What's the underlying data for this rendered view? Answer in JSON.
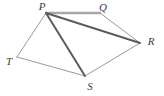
{
  "figure": {
    "background_color": "#ffffff",
    "width": 164,
    "height": 96,
    "labels": {
      "p": "P",
      "q": "Q",
      "r": "R",
      "s": "S",
      "t": "T"
    },
    "vertices": [
      {
        "name": "P",
        "label": "P",
        "x": 46,
        "y": 13,
        "label_x": 42,
        "label_y": 7
      },
      {
        "name": "Q",
        "label": "Q",
        "x": 100,
        "y": 13,
        "label_x": 103,
        "label_y": 8
      },
      {
        "name": "R",
        "label": "R",
        "x": 140,
        "y": 43,
        "label_x": 151,
        "label_y": 42
      },
      {
        "name": "S",
        "label": "S",
        "x": 85,
        "y": 76,
        "label_x": 90,
        "label_y": 87
      },
      {
        "name": "T",
        "label": "T",
        "x": 17,
        "y": 57,
        "label_x": 9,
        "label_y": 62
      }
    ],
    "edges": [
      {
        "name": "PQ",
        "from": "P",
        "to": "Q",
        "x1": 46,
        "y1": 13,
        "x2": 100,
        "y2": 13,
        "color": "#a8a8a8",
        "width": 2.4
      },
      {
        "name": "QR",
        "from": "Q",
        "to": "R",
        "x1": 100,
        "y1": 13,
        "x2": 140,
        "y2": 43,
        "color": "#8d8d8d",
        "width": 0.9
      },
      {
        "name": "RS",
        "from": "R",
        "to": "S",
        "x1": 140,
        "y1": 43,
        "x2": 85,
        "y2": 76,
        "color": "#8d8d8d",
        "width": 0.9
      },
      {
        "name": "ST",
        "from": "S",
        "to": "T",
        "x1": 85,
        "y1": 76,
        "x2": 17,
        "y2": 57,
        "color": "#8d8d8d",
        "width": 0.9
      },
      {
        "name": "TP",
        "from": "T",
        "to": "P",
        "x1": 17,
        "y1": 57,
        "x2": 46,
        "y2": 13,
        "color": "#8d8d8d",
        "width": 0.9
      },
      {
        "name": "PR",
        "from": "P",
        "to": "R",
        "x1": 46,
        "y1": 13,
        "x2": 140,
        "y2": 43,
        "color": "#5c5c5c",
        "width": 2.0
      },
      {
        "name": "PS",
        "from": "P",
        "to": "S",
        "x1": 46,
        "y1": 13,
        "x2": 85,
        "y2": 76,
        "color": "#5c5c5c",
        "width": 2.0
      }
    ]
  }
}
